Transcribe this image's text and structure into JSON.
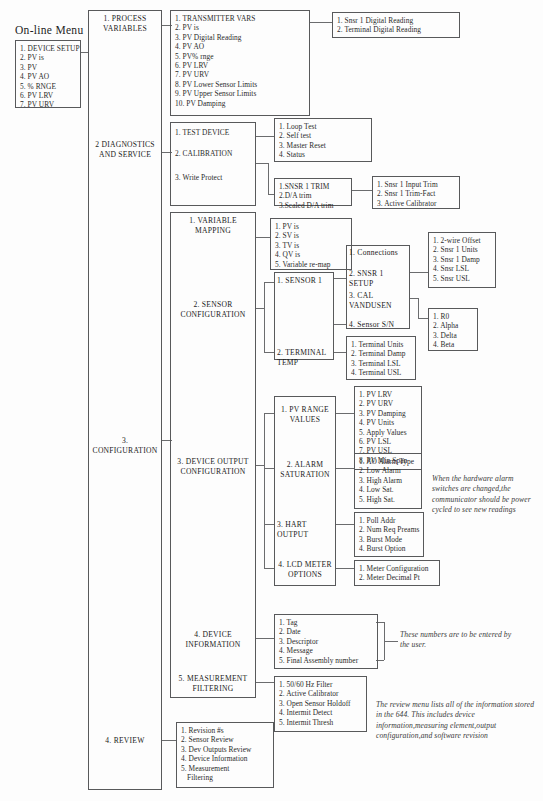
{
  "title": "On-line Menu",
  "root_menu": {
    "name": "device-setup-menu",
    "items": [
      "1. DEVICE SETUP",
      "2. PV is",
      "3. PV",
      "4. PV AO",
      "5. % RNGE",
      "6. PV LRV",
      "7. PV URV"
    ]
  },
  "level1": {
    "process_variables": "1. PROCESS\nVARIABLES",
    "diagnostics": "2 DIAGNOSTICS\nAND SERVICE",
    "configuration": "3. CONFIGURATION",
    "review": "4. REVIEW"
  },
  "process_variables": {
    "items": [
      "1. TRANSMITTER VARS",
      "2. PV is",
      "3. PV Digital Reading",
      "4. PV AO",
      "5. PV% rnge",
      "6. PV LRV",
      "7. PV URV",
      "8. PV Lower Sensor Limits",
      "9. PV Upper Sensor Limits",
      "10. PV Damping"
    ],
    "transmitter_vars": [
      "1. Snsr 1 Digital Reading",
      "2. Terminal Digital Reading"
    ]
  },
  "diagnostics": {
    "items": [
      "1. TEST DEVICE",
      "2. CALIBRATION",
      "3. Write Protect"
    ],
    "test_device": [
      "1. Loop Test",
      "2. Self test",
      "3. Master Reset",
      "4. Status"
    ],
    "calibration": [
      "1.SNSR 1 TRIM",
      "2.D/A trim",
      "3.Scaled D/A  trim"
    ],
    "snsr1_trim": [
      "1. Snsr 1 Input Trim",
      "2. Snsr 1 Trim-Fact",
      "3. Active Calibrator"
    ]
  },
  "configuration": {
    "items": [
      "1. VARIABLE\nMAPPING",
      "2. SENSOR\nCONFIGURATION",
      "3. DEVICE OUTPUT\nCONFIGURATION",
      "4. DEVICE\nINFORMATION",
      "5. MEASUREMENT\nFILTERING"
    ],
    "variable_mapping": [
      "1. PV is",
      "2. SV is",
      "3. TV is",
      "4. QV is",
      "5. Variable re-map"
    ],
    "sensor_configuration": [
      "1. SENSOR 1",
      "2. TERMINAL TEMP"
    ],
    "sensor1": [
      "1. Connections",
      "2. SNSR 1 SETUP",
      "3. CAL VANDUSEN",
      "4. Sensor S/N"
    ],
    "snsr1_setup": [
      "1. 2-wire Offset",
      "2. Snsr 1 Units",
      "3. Snsr 1 Damp",
      "4. Snsr LSL",
      "5. Snsr USL"
    ],
    "cal_vandusen": [
      "1. R0",
      "2. Alpha",
      "3. Delta",
      "4. Beta"
    ],
    "terminal_temp": [
      "1. Terminal Units",
      "2. Terminal Damp",
      "3. Terminal LSL",
      "4. Terminal USL"
    ],
    "device_output": [
      "1. PV RANGE\nVALUES",
      "2. ALARM\nSATURATION",
      "3. HART OUTPUT",
      "4. LCD METER\nOPTIONS"
    ],
    "pv_range_values": [
      "1. PV LRV",
      "2. PV URV",
      "3. PV Damping",
      "4. PV Units",
      "5. Apply Values",
      "6. PV LSL",
      "7. PV USL",
      "8. PV Min.Span"
    ],
    "alarm_saturation": [
      "1. AO Alarm Type",
      "2. Low Alarm",
      "3. High Alarm",
      "4. Low Sat.",
      "5. High Sat."
    ],
    "hart_output": [
      "1. Poll Addr",
      "2. Num Req Preams",
      "3. Burst Mode",
      "4. Burst Option"
    ],
    "lcd_meter_options": [
      "1. Meter Configuration",
      "2. Meter Decimal Pt"
    ],
    "device_information": [
      "1. Tag",
      "2. Date",
      "3. Descriptor",
      "4. Message",
      "5. Final Assembly number"
    ],
    "measurement_filtering": [
      "1. 50/60 Hz Filter",
      "2. Active Calibrator",
      "3. Open Sensor Holdoff",
      "4. Intermit Detect",
      "5. Intermit Thresh"
    ]
  },
  "review": {
    "items": [
      "1. Revision #s",
      "2. Sensor Review",
      "3. Dev Outputs Review",
      "4. Device Information",
      "5. Measurement",
      "Filtering"
    ]
  },
  "notes": {
    "alarm_note": "When the hardware alarm switches are changed,the communicator should be power cycled to see new readings",
    "device_info_note": "These numbers are to be entered by the user.",
    "review_note": "The review menu lists all of the information stored in the 644. This includes device information,measuring element,output configuration,and software revision"
  }
}
